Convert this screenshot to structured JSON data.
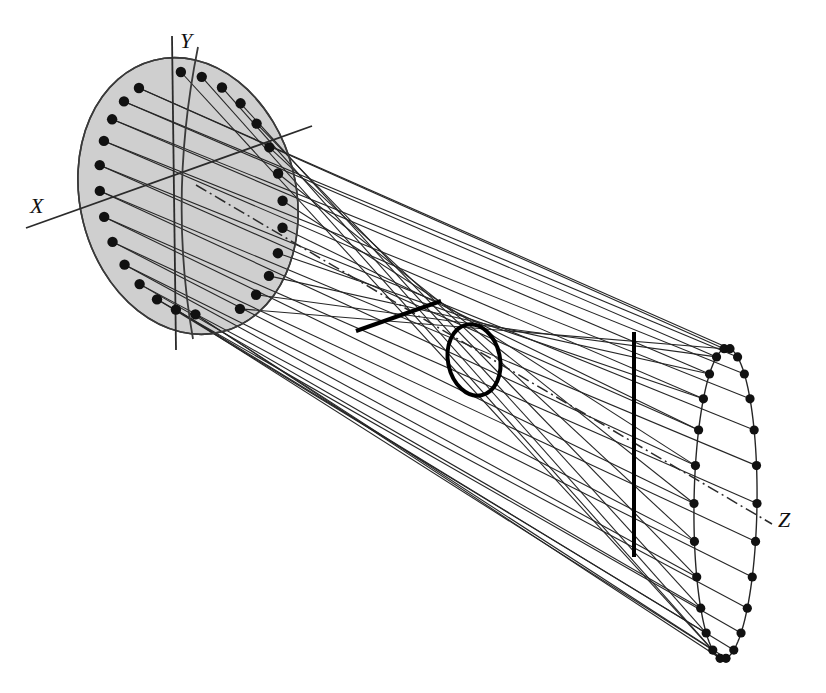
{
  "figure": {
    "background_color": "#ffffff",
    "line_color": "#262626",
    "bold_line_color": "#000000",
    "dot_color": "#111111",
    "aperture_fill": "#cfcfcf",
    "aperture_stroke": "#3a3a3a",
    "width": 826,
    "height": 693
  },
  "axes": {
    "x": {
      "label": "X",
      "label_x": 30,
      "label_y": 213,
      "line": {
        "x1": 26,
        "y1": 228,
        "x2": 312,
        "y2": 126
      },
      "style": "solid"
    },
    "y": {
      "label": "Y",
      "label_x": 180,
      "label_y": 48,
      "line": {
        "x1": 172,
        "y1": 36,
        "x2": 176,
        "y2": 350
      },
      "style": "solid"
    },
    "z": {
      "label": "Z",
      "label_x": 778,
      "label_y": 527,
      "line": {
        "x1": 196,
        "y1": 185,
        "x2": 772,
        "y2": 524
      },
      "style": "dash-dot"
    }
  },
  "left_aperture": {
    "name": "shaded-elliptical-aperture",
    "center_x": 188,
    "center_y": 196,
    "radius_x": 108,
    "radius_y": 140,
    "rotation_deg": -14,
    "meridian_arc": "M 198 47 Q 168 196 193 339",
    "dot_count": 26
  },
  "waist": {
    "name": "beam-waist-circle",
    "center_x": 474,
    "center_y": 360,
    "radius_x": 26,
    "radius_y": 36,
    "rotation_deg": -12,
    "stroke_width": 4
  },
  "near_stop": {
    "name": "near-field-stop-bar",
    "x1": 356,
    "y1": 331,
    "x2": 441,
    "y2": 301,
    "stroke_width": 4
  },
  "far_stop": {
    "name": "far-field-stop-bar",
    "x1": 634,
    "y1": 332,
    "x2": 634,
    "y2": 557,
    "stroke_width": 4
  },
  "right_aperture": {
    "name": "far-elliptical-aperture",
    "top_x": 727,
    "top_y": 348,
    "bottom_x": 723,
    "bottom_y": 659,
    "left_bulge": 694,
    "right_bulge": 757,
    "dot_count": 26
  },
  "rays": {
    "count": 26,
    "description": "Straight rays from each aperture dot crossing at the waist and reaching the far aperture dots",
    "stroke_width": 1.1
  }
}
